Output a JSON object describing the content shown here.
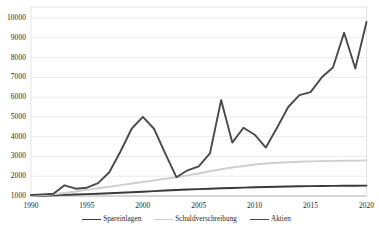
{
  "chart_data": {
    "type": "line",
    "title": "",
    "subtitle": "",
    "xlabel": "",
    "ylabel": "",
    "xlim": [
      1990,
      2020
    ],
    "ylim": [
      1000,
      10000
    ],
    "grid": true,
    "legend_position": "bottom",
    "x_ticks": [
      "1990",
      "1995",
      "2000",
      "2005",
      "2010",
      "2015",
      "2020"
    ],
    "y_ticks": [
      "1000",
      "2000",
      "3000",
      "4000",
      "5000",
      "6000",
      "7000",
      "8000",
      "9000",
      "10000"
    ],
    "x": [
      1990,
      1991,
      1992,
      1993,
      1994,
      1995,
      1996,
      1997,
      1998,
      1999,
      2000,
      2001,
      2002,
      2003,
      2004,
      2005,
      2006,
      2007,
      2008,
      2009,
      2010,
      2011,
      2012,
      2013,
      2014,
      2015,
      2016,
      2017,
      2018,
      2019,
      2020
    ],
    "series": [
      {
        "name": "Spareinlagen",
        "color": "#3a3a3a",
        "width": 1.9,
        "values": [
          1000,
          1010,
          1030,
          1055,
          1075,
          1095,
          1115,
          1140,
          1165,
          1190,
          1215,
          1245,
          1275,
          1305,
          1330,
          1350,
          1370,
          1390,
          1405,
          1425,
          1440,
          1455,
          1470,
          1480,
          1490,
          1500,
          1505,
          1510,
          1515,
          1520,
          1525
        ]
      },
      {
        "name": "Schuldverschreibung",
        "color": "#cfcfcf",
        "width": 1.9,
        "values": [
          1000,
          1040,
          1090,
          1150,
          1230,
          1310,
          1390,
          1470,
          1550,
          1630,
          1710,
          1790,
          1870,
          1950,
          2040,
          2140,
          2250,
          2350,
          2440,
          2520,
          2590,
          2640,
          2680,
          2710,
          2730,
          2750,
          2765,
          2775,
          2785,
          2790,
          2800
        ]
      },
      {
        "name": "Aktien",
        "color": "#4a4a4a",
        "width": 1.9,
        "values": [
          1050,
          1080,
          1110,
          1540,
          1370,
          1420,
          1650,
          2200,
          3250,
          4400,
          5000,
          4400,
          3150,
          1950,
          2300,
          2500,
          3150,
          5850,
          3700,
          4450,
          4100,
          3450,
          4450,
          5500,
          6100,
          6250,
          7000,
          7500,
          9250,
          7450,
          9800
        ]
      }
    ]
  },
  "legend": {
    "entries": [
      {
        "label": "Spareinlagen"
      },
      {
        "label": "Schuldverschreibung"
      },
      {
        "label": "Aktien"
      }
    ]
  }
}
